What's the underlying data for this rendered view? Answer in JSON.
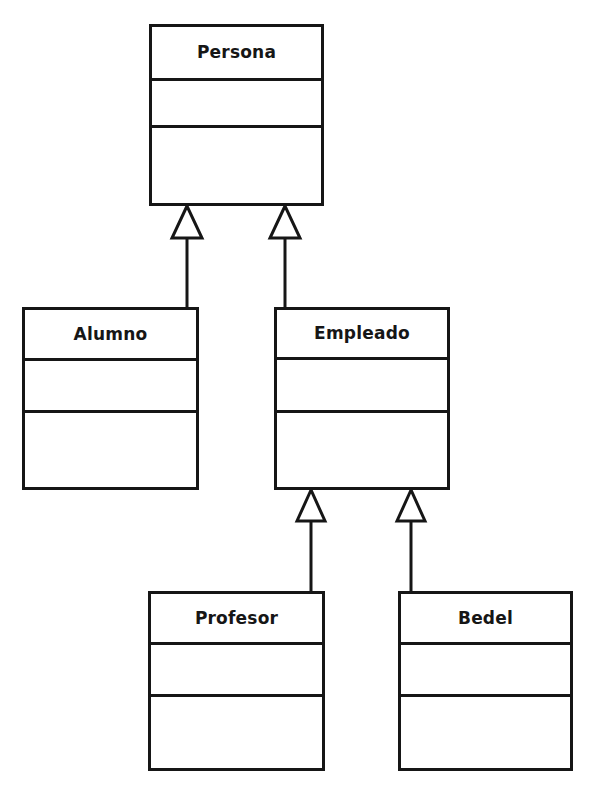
{
  "diagram": {
    "type": "uml-class-diagram",
    "background_color": "#ffffff",
    "line_color": "#161616",
    "line_width": 3,
    "canvas": {
      "width": 590,
      "height": 795
    },
    "classes": [
      {
        "id": "persona",
        "name": "Persona",
        "attributes": [],
        "operations": [],
        "box": {
          "x": 149,
          "y": 24,
          "width": 175,
          "height": 182
        },
        "compartment_heights": [
          54,
          47,
          78
        ]
      },
      {
        "id": "alumno",
        "name": "Alumno",
        "attributes": [],
        "operations": [],
        "box": {
          "x": 22,
          "y": 307,
          "width": 177,
          "height": 183
        },
        "compartment_heights": [
          51,
          52,
          77
        ]
      },
      {
        "id": "empleado",
        "name": "Empleado",
        "attributes": [],
        "operations": [],
        "box": {
          "x": 274,
          "y": 307,
          "width": 176,
          "height": 183
        },
        "compartment_heights": [
          50,
          53,
          77
        ]
      },
      {
        "id": "profesor",
        "name": "Profesor",
        "attributes": [],
        "operations": [],
        "box": {
          "x": 148,
          "y": 591,
          "width": 177,
          "height": 180
        },
        "compartment_heights": [
          51,
          52,
          74
        ]
      },
      {
        "id": "bedel",
        "name": "Bedel",
        "attributes": [],
        "operations": [],
        "box": {
          "x": 398,
          "y": 591,
          "width": 175,
          "height": 180
        },
        "compartment_heights": [
          51,
          52,
          74
        ]
      }
    ],
    "generalizations": [
      {
        "id": "alumno-to-persona",
        "type": "generalization",
        "child": "alumno",
        "parent": "persona",
        "arrowhead": "hollow-triangle",
        "arrow_tip": {
          "x": 187,
          "y": 206
        },
        "arrow_base_y": 238,
        "arrow_half_width": 15,
        "line": {
          "x": 187,
          "y1": 238,
          "y2": 308
        }
      },
      {
        "id": "empleado-to-persona",
        "type": "generalization",
        "child": "empleado",
        "parent": "persona",
        "arrowhead": "hollow-triangle",
        "arrow_tip": {
          "x": 285,
          "y": 206
        },
        "arrow_base_y": 238,
        "arrow_half_width": 15,
        "line": {
          "x": 285,
          "y1": 238,
          "y2": 308
        }
      },
      {
        "id": "profesor-to-empleado",
        "type": "generalization",
        "child": "profesor",
        "parent": "empleado",
        "arrowhead": "hollow-triangle",
        "arrow_tip": {
          "x": 311,
          "y": 490
        },
        "arrow_base_y": 521,
        "arrow_half_width": 14,
        "line": {
          "x": 311,
          "y1": 521,
          "y2": 592
        }
      },
      {
        "id": "bedel-to-empleado",
        "type": "generalization",
        "child": "bedel",
        "parent": "empleado",
        "arrowhead": "hollow-triangle",
        "arrow_tip": {
          "x": 411,
          "y": 490
        },
        "arrow_base_y": 521,
        "arrow_half_width": 14,
        "line": {
          "x": 411,
          "y1": 521,
          "y2": 592
        }
      }
    ]
  }
}
